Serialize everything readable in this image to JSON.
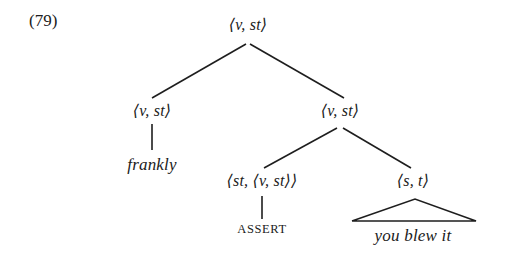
{
  "figure": {
    "example_number": "(79)",
    "caption_text": "",
    "background_color": "#ffffff",
    "line_color": "#1e1e1e"
  },
  "tree": {
    "nodes": [
      {
        "id": "root",
        "label": "⟨v, st⟩",
        "x": 248,
        "y": 24,
        "style": "type"
      },
      {
        "id": "left-vst",
        "label": "⟨v, st⟩",
        "x": 152,
        "y": 110,
        "style": "type"
      },
      {
        "id": "frankly",
        "label": "frankly",
        "x": 152,
        "y": 165,
        "style": "leaf"
      },
      {
        "id": "right-vst",
        "label": "⟨v, st⟩",
        "x": 340,
        "y": 110,
        "style": "type"
      },
      {
        "id": "assert-type",
        "label": "⟨st, ⟨v, st⟩⟩",
        "x": 262,
        "y": 180,
        "style": "type"
      },
      {
        "id": "assert-op",
        "label": "ASSERT",
        "x": 262,
        "y": 229,
        "style": "op"
      },
      {
        "id": "st-type",
        "label": "⟨s, t⟩",
        "x": 413,
        "y": 180,
        "style": "type"
      },
      {
        "id": "you-blew-it",
        "label": "you blew it",
        "x": 413,
        "y": 236,
        "style": "leaf"
      }
    ],
    "edges": [
      {
        "from": "root",
        "to": "left-vst",
        "kind": "branch"
      },
      {
        "from": "root",
        "to": "right-vst",
        "kind": "branch"
      },
      {
        "from": "left-vst",
        "to": "frankly",
        "kind": "stem"
      },
      {
        "from": "right-vst",
        "to": "assert-type",
        "kind": "branch"
      },
      {
        "from": "right-vst",
        "to": "st-type",
        "kind": "branch"
      },
      {
        "from": "assert-type",
        "to": "assert-op",
        "kind": "stem"
      },
      {
        "from": "st-type",
        "to": "you-blew-it",
        "kind": "triangle"
      }
    ],
    "geometry": {
      "root_branch_left": {
        "x1": 246,
        "y1": 44,
        "x2": 152,
        "y2": 98
      },
      "root_branch_right": {
        "x1": 250,
        "y1": 44,
        "x2": 344,
        "y2": 98
      },
      "frankly_stem": {
        "x1": 152,
        "y1": 124,
        "x2": 152,
        "y2": 150
      },
      "right_branch_left": {
        "x1": 337,
        "y1": 128,
        "x2": 264,
        "y2": 168
      },
      "right_branch_right": {
        "x1": 343,
        "y1": 128,
        "x2": 411,
        "y2": 168
      },
      "assert_stem": {
        "x1": 262,
        "y1": 196,
        "x2": 262,
        "y2": 219
      },
      "triangle": {
        "apex_x": 415,
        "apex_y": 199,
        "left_x": 352,
        "right_x": 476,
        "base_y": 221
      }
    }
  }
}
